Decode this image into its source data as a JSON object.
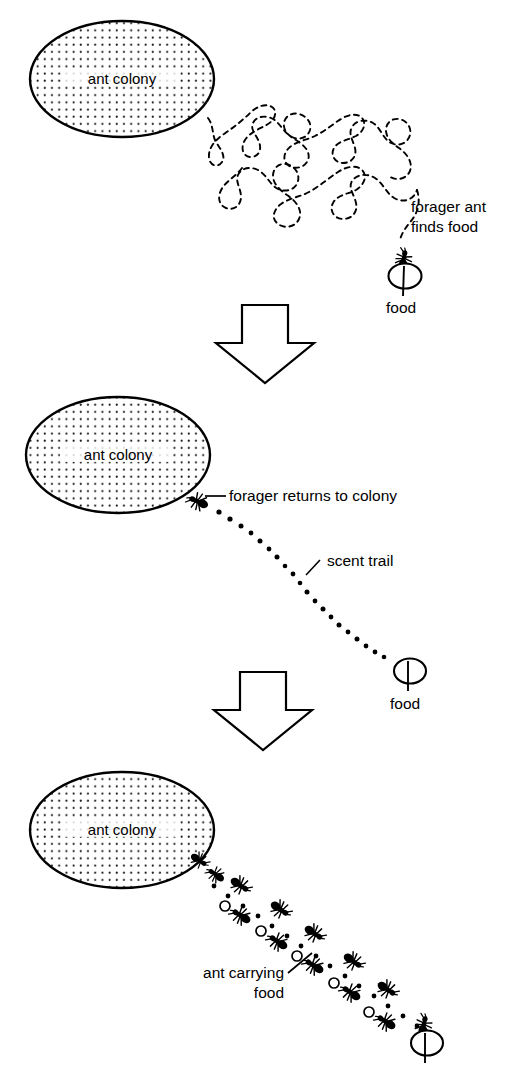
{
  "figure": {
    "type": "scientific-illustration",
    "background_color": "#ffffff",
    "ink_color": "#000000",
    "panel_count": 3
  },
  "panels": [
    {
      "id": "panel-1",
      "sequence": "1",
      "colony_label": "ant colony",
      "labels": [
        {
          "id": "forager-finds",
          "line1": "forager ant",
          "line2": "finds food"
        },
        {
          "id": "food",
          "text": "food"
        }
      ],
      "path_style": "dashed",
      "path_description": "meandering random search path"
    },
    {
      "id": "panel-2",
      "sequence": "2",
      "colony_label": "ant colony",
      "labels": [
        {
          "id": "forager-returns",
          "text": "forager returns to colony"
        },
        {
          "id": "scent-trail",
          "text": "scent trail"
        },
        {
          "id": "food",
          "text": "food"
        }
      ],
      "path_style": "dotted",
      "path_description": "straight dotted scent trail from food to colony"
    },
    {
      "id": "panel-3",
      "sequence": "3",
      "colony_label": "ant colony",
      "labels": [
        {
          "id": "ant-carrying-food",
          "line1": "ant carrying",
          "line2": "food"
        }
      ],
      "path_style": "dotted-with-ants",
      "path_description": "column of ants marching along scent trail carrying food"
    }
  ],
  "connectors": [
    {
      "id": "step-arrow-1",
      "icon": "down-arrow-icon",
      "from_panel": "panel-1",
      "to_panel": "panel-2"
    },
    {
      "id": "step-arrow-2",
      "icon": "down-arrow-icon",
      "from_panel": "panel-2",
      "to_panel": "panel-3"
    }
  ],
  "icons": {
    "colony": "stippled-ellipse-icon",
    "ant": "ant-icon",
    "food": "food-seed-icon",
    "arrow": "down-arrow-icon"
  },
  "colors": {
    "ink": "#000000",
    "paper": "#ffffff",
    "stipple": "#1a1a1a"
  }
}
